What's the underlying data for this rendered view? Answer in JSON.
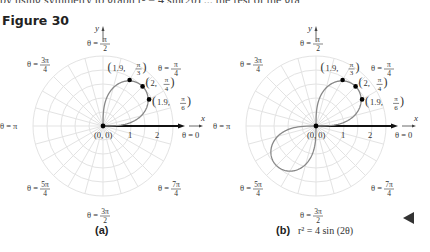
{
  "page": {
    "cut_text": "by using symmetry to graph r² = 4 sin(2θ) ... the rest of the graph",
    "figure_title": "Figure 30"
  },
  "panels": [
    {
      "id": "a",
      "caption": "(a)",
      "equation": "",
      "origin_label": "(0, 0)",
      "axis_x": "x",
      "axis_y": "y",
      "tick_labels": [
        "1",
        "2"
      ],
      "angle_labels": {
        "zero": "θ = 0",
        "pi_4": [
          "θ =",
          "π",
          "4"
        ],
        "pi_2": [
          "θ =",
          "π",
          "2"
        ],
        "three_pi_4": [
          "θ =",
          "3π",
          "4"
        ],
        "pi": "θ = π",
        "five_pi_4": [
          "θ =",
          "5π",
          "4"
        ],
        "three_pi_2": [
          "θ =",
          "3π",
          "2"
        ],
        "seven_pi_4": [
          "θ =",
          "7π",
          "4"
        ]
      },
      "points": [
        {
          "label_r": "1.9",
          "label_theta_num": "π",
          "label_theta_den": "3"
        },
        {
          "label_r": "2",
          "label_theta_num": "π",
          "label_theta_den": "4"
        },
        {
          "label_r": "1.9",
          "label_theta_num": "π",
          "label_theta_den": "6"
        }
      ]
    },
    {
      "id": "b",
      "caption": "(b)",
      "equation": "r² = 4 sin (2θ)",
      "origin_label": "(0, 0)",
      "axis_x": "x",
      "axis_y": "y",
      "tick_labels": [
        "1",
        "2"
      ],
      "points": [
        {
          "label_r": "1.9",
          "label_theta_num": "π",
          "label_theta_den": "3"
        },
        {
          "label_r": "2",
          "label_theta_num": "π",
          "label_theta_den": "4"
        },
        {
          "label_r": "1.9",
          "label_theta_num": "π",
          "label_theta_den": "6"
        }
      ]
    }
  ],
  "chart_data": [
    {
      "type": "scatter",
      "title": "Figure 30 (a)",
      "coordinate_system": "polar",
      "xlabel": "x",
      "ylabel": "y",
      "radial_ticks": [
        1,
        2
      ],
      "angle_labels": [
        "0",
        "π/4",
        "π/2",
        "3π/4",
        "π",
        "5π/4",
        "3π/2",
        "7π/4"
      ],
      "grid": true,
      "series": [
        {
          "name": "plotted points",
          "points": [
            {
              "r": 0,
              "theta": "0"
            },
            {
              "r": 1.9,
              "theta": "π/6"
            },
            {
              "r": 2,
              "theta": "π/4"
            },
            {
              "r": 1.9,
              "theta": "π/3"
            },
            {
              "r": 0,
              "theta": "π/2"
            }
          ]
        },
        {
          "name": "curve",
          "equation": "r^2 = 4 sin(2θ)",
          "theta_range": "0 to π/2"
        }
      ]
    },
    {
      "type": "line",
      "title": "Figure 30 (b)  r² = 4 sin (2θ)",
      "coordinate_system": "polar",
      "xlabel": "x",
      "ylabel": "y",
      "radial_ticks": [
        1,
        2
      ],
      "angle_labels": [
        "0",
        "π/4",
        "π/2",
        "3π/4",
        "π",
        "5π/4",
        "3π/2",
        "7π/4"
      ],
      "grid": true,
      "series": [
        {
          "name": "lemniscate",
          "equation": "r^2 = 4 sin(2θ)",
          "lobes": [
            "first quadrant",
            "third quadrant"
          ],
          "max_r": 2
        },
        {
          "name": "labeled points",
          "points": [
            {
              "r": 1.9,
              "theta": "π/3"
            },
            {
              "r": 2,
              "theta": "π/4"
            },
            {
              "r": 1.9,
              "theta": "π/6"
            }
          ]
        }
      ]
    }
  ]
}
